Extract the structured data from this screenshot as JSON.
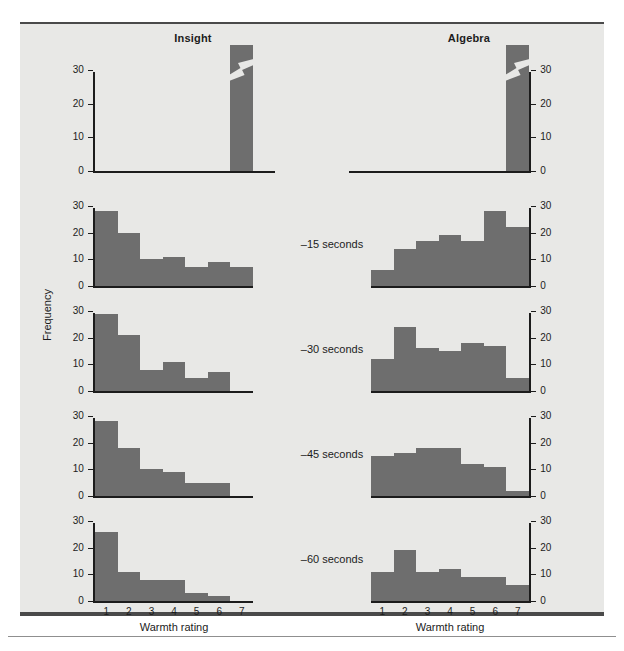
{
  "figure": {
    "columns": [
      "Insight",
      "Algebra"
    ],
    "ylabel": "Frequency",
    "xlabel": "Warmth rating",
    "xticklabels": [
      "1",
      "2",
      "3",
      "4",
      "5",
      "6",
      "7"
    ],
    "yticklabels": [
      "0",
      "10",
      "20",
      "30"
    ],
    "row_labels": [
      "",
      "–15 seconds",
      "–30 seconds",
      "–45 seconds",
      "–60 seconds"
    ],
    "bar_color": "#6e6e6e",
    "axis_color": "#1c1c1c",
    "background": "#e8e8e6"
  },
  "chart_data": {
    "type": "bar",
    "xlabel": "Warmth rating",
    "ylabel": "Frequency",
    "categories": [
      "1",
      "2",
      "3",
      "4",
      "5",
      "6",
      "7"
    ],
    "ylim": [
      0,
      30
    ],
    "grid": false,
    "legend": "none",
    "panels": [
      {
        "row_label": "solution",
        "column": "Insight",
        "values": [
          0,
          0,
          0,
          0,
          0,
          0,
          44
        ],
        "axis_break": true,
        "note": "bar at rating 7 exceeds axis; break mark drawn"
      },
      {
        "row_label": "solution",
        "column": "Algebra",
        "values": [
          0,
          0,
          0,
          0,
          0,
          0,
          44
        ],
        "axis_break": true,
        "note": "bar at rating 7 exceeds axis; break mark drawn"
      },
      {
        "row_label": "–15 seconds",
        "column": "Insight",
        "values": [
          28,
          20,
          10,
          11,
          7,
          9,
          7
        ],
        "axis_break": false
      },
      {
        "row_label": "–15 seconds",
        "column": "Algebra",
        "values": [
          6,
          14,
          17,
          19,
          17,
          28,
          22
        ],
        "axis_break": false
      },
      {
        "row_label": "–30 seconds",
        "column": "Insight",
        "values": [
          29,
          21,
          8,
          11,
          5,
          7,
          0
        ],
        "axis_break": false
      },
      {
        "row_label": "–30 seconds",
        "column": "Algebra",
        "values": [
          12,
          24,
          16,
          15,
          18,
          17,
          5
        ],
        "axis_break": false
      },
      {
        "row_label": "–45 seconds",
        "column": "Insight",
        "values": [
          28,
          18,
          10,
          9,
          5,
          5,
          0
        ],
        "axis_break": false
      },
      {
        "row_label": "–45 seconds",
        "column": "Algebra",
        "values": [
          15,
          16,
          18,
          18,
          12,
          11,
          2
        ],
        "axis_break": false
      },
      {
        "row_label": "–60 seconds",
        "column": "Insight",
        "values": [
          26,
          11,
          8,
          8,
          3,
          2,
          0
        ],
        "axis_break": false
      },
      {
        "row_label": "–60 seconds",
        "column": "Algebra",
        "values": [
          11,
          19,
          11,
          12,
          9,
          9,
          6
        ],
        "axis_break": false
      }
    ]
  }
}
